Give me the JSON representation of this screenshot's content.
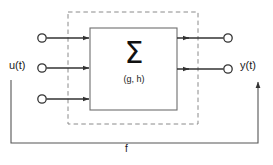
{
  "diagram": {
    "colors": {
      "line": "#333333",
      "dashed_boundary": "#888888",
      "box_border": "#6e6e6e",
      "background": "#ffffff",
      "text": "#1a1a1a"
    },
    "labels": {
      "input_signal": "u(t)",
      "output_signal": "y(t)",
      "feedback": "f",
      "block_operator": "Σ",
      "block_parameters": "(g, h)"
    },
    "nodes": {
      "inputs": [
        {
          "name": "input-port-1",
          "cx": 42,
          "cy": 38
        },
        {
          "name": "input-port-2",
          "cx": 42,
          "cy": 68
        },
        {
          "name": "input-port-3",
          "cx": 42,
          "cy": 99
        }
      ],
      "outputs": [
        {
          "name": "output-port-1",
          "cx": 228,
          "cy": 38
        },
        {
          "name": "output-port-2",
          "cx": 228,
          "cy": 69
        }
      ]
    },
    "block": {
      "x": 90,
      "y": 28,
      "width": 87,
      "height": 82
    },
    "boundary": {
      "x": 68,
      "y": 12,
      "width": 130,
      "height": 112,
      "style": "dashed"
    },
    "feedback_path": {
      "from_x": 258,
      "from_y": 80,
      "bottom_y": 143,
      "to_x": 11,
      "to_y": 80
    }
  }
}
